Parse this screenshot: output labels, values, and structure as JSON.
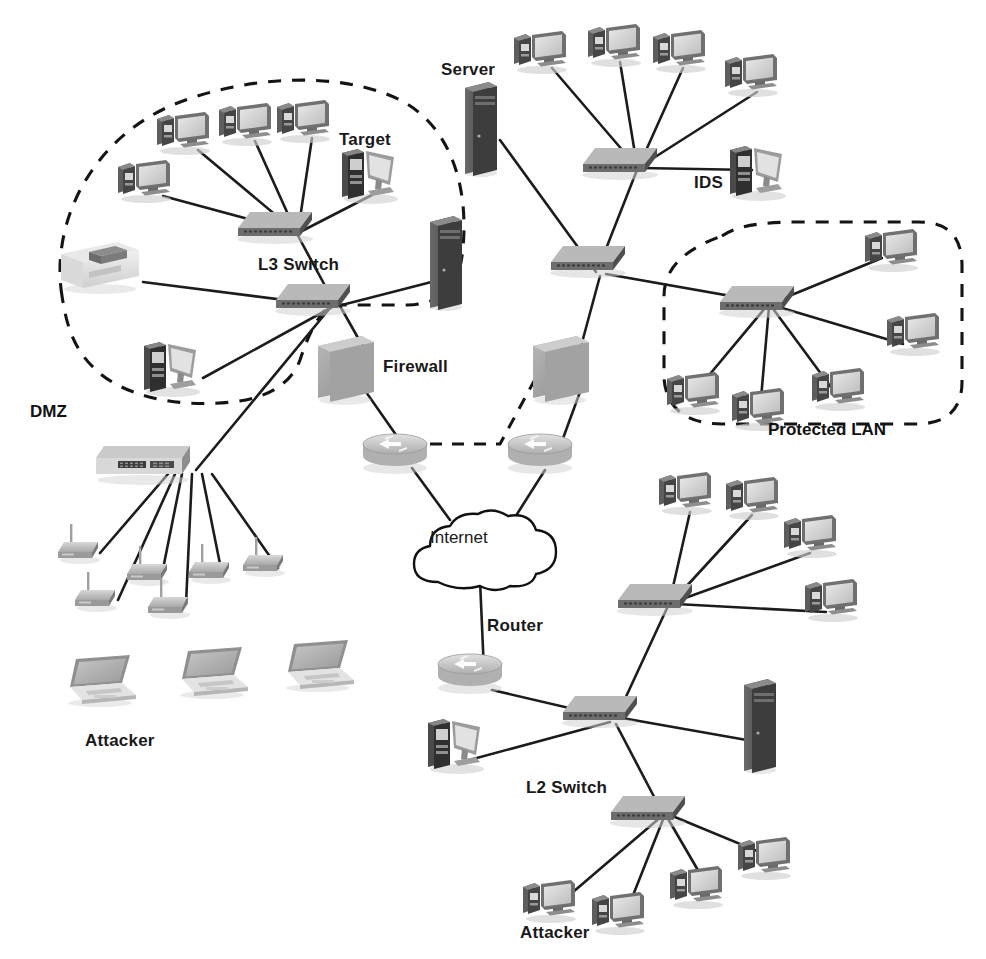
{
  "diagram": {
    "width": 986,
    "height": 959,
    "background_color": "#ffffff",
    "link_color": "#1c1c1c",
    "dashed_zone_color": "#141414"
  },
  "labels": {
    "dmz": "DMZ",
    "protected_lan": "Protected LAN",
    "l3_switch": "L3 Switch",
    "l2_switch": "L2 Switch",
    "target": "Target",
    "server": "Server",
    "ids": "IDS",
    "firewall": "Firewall",
    "internet": "Internet",
    "router": "Router",
    "attacker_left": "Attacker",
    "attacker_bottom": "Attacker"
  },
  "zones": [
    {
      "id": "dmz",
      "label": "DMZ",
      "label_x": 30,
      "label_y": 402,
      "style": "dashed-blob"
    },
    {
      "id": "protected-lan",
      "label": "Protected LAN",
      "label_x": 768,
      "label_y": 422,
      "style": "dashed-rounded"
    }
  ],
  "nodes": [
    {
      "id": "dmz-pc-1",
      "type": "desktop-pc",
      "x": 134,
      "y": 178,
      "label": ""
    },
    {
      "id": "dmz-pc-2",
      "type": "desktop-pc",
      "x": 173,
      "y": 130,
      "label": ""
    },
    {
      "id": "dmz-pc-3",
      "type": "desktop-pc",
      "x": 235,
      "y": 121,
      "label": ""
    },
    {
      "id": "dmz-pc-4",
      "type": "desktop-pc",
      "x": 293,
      "y": 118,
      "label": ""
    },
    {
      "id": "dmz-target",
      "type": "workstation",
      "x": 358,
      "y": 170,
      "label": "Target"
    },
    {
      "id": "dmz-printer",
      "type": "printer",
      "x": 90,
      "y": 262,
      "label": ""
    },
    {
      "id": "dmz-server",
      "type": "server-tower",
      "x": 440,
      "y": 255,
      "label": ""
    },
    {
      "id": "dmz-ws-low",
      "type": "workstation",
      "x": 163,
      "y": 363,
      "label": ""
    },
    {
      "id": "dmz-sw-top",
      "type": "switch",
      "x": 275,
      "y": 222,
      "label": ""
    },
    {
      "id": "l3-switch",
      "type": "switch",
      "x": 312,
      "y": 292,
      "label": "L3 Switch"
    },
    {
      "id": "core-pc-1",
      "type": "desktop-pc",
      "x": 530,
      "y": 49,
      "label": ""
    },
    {
      "id": "core-pc-2",
      "type": "desktop-pc",
      "x": 604,
      "y": 42,
      "label": ""
    },
    {
      "id": "core-pc-3",
      "type": "desktop-pc",
      "x": 669,
      "y": 48,
      "label": ""
    },
    {
      "id": "core-pc-4",
      "type": "desktop-pc",
      "x": 741,
      "y": 72,
      "label": ""
    },
    {
      "id": "main-server",
      "type": "server-tower",
      "x": 481,
      "y": 122,
      "label": "Server"
    },
    {
      "id": "core-switch",
      "type": "switch",
      "x": 620,
      "y": 156,
      "label": ""
    },
    {
      "id": "ids",
      "type": "workstation",
      "x": 752,
      "y": 168,
      "label": "IDS"
    },
    {
      "id": "dist-switch",
      "type": "switch",
      "x": 588,
      "y": 262,
      "label": ""
    },
    {
      "id": "firewall-left",
      "type": "firewall",
      "x": 344,
      "y": 358,
      "label": "Firewall"
    },
    {
      "id": "firewall-right",
      "type": "firewall",
      "x": 556,
      "y": 358,
      "label": ""
    },
    {
      "id": "router-left",
      "type": "router",
      "x": 392,
      "y": 452,
      "label": ""
    },
    {
      "id": "router-right",
      "type": "router",
      "x": 537,
      "y": 452,
      "label": ""
    },
    {
      "id": "internet",
      "type": "cloud",
      "x": 470,
      "y": 540,
      "label": "Internet"
    },
    {
      "id": "router-bottom",
      "type": "router",
      "x": 468,
      "y": 670,
      "label": "Router"
    },
    {
      "id": "lan-switch",
      "type": "switch",
      "x": 757,
      "y": 295,
      "label": ""
    },
    {
      "id": "lan-pc-1",
      "type": "desktop-pc",
      "x": 881,
      "y": 247,
      "label": ""
    },
    {
      "id": "lan-pc-2",
      "type": "desktop-pc",
      "x": 903,
      "y": 331,
      "label": ""
    },
    {
      "id": "lan-pc-3",
      "type": "desktop-pc",
      "x": 683,
      "y": 390,
      "label": ""
    },
    {
      "id": "lan-pc-4",
      "type": "desktop-pc",
      "x": 748,
      "y": 406,
      "label": ""
    },
    {
      "id": "lan-pc-5",
      "type": "desktop-pc",
      "x": 828,
      "y": 386,
      "label": ""
    },
    {
      "id": "ap-switch",
      "type": "rack-switch",
      "x": 140,
      "y": 460,
      "label": ""
    },
    {
      "id": "ap-1",
      "type": "access-point",
      "x": 78,
      "y": 545,
      "label": ""
    },
    {
      "id": "ap-2",
      "type": "access-point",
      "x": 95,
      "y": 593,
      "label": ""
    },
    {
      "id": "ap-3",
      "type": "access-point",
      "x": 147,
      "y": 567,
      "label": ""
    },
    {
      "id": "ap-4",
      "type": "access-point",
      "x": 168,
      "y": 600,
      "label": ""
    },
    {
      "id": "ap-5",
      "type": "access-point",
      "x": 209,
      "y": 565,
      "label": ""
    },
    {
      "id": "ap-6",
      "type": "access-point",
      "x": 263,
      "y": 558,
      "label": ""
    },
    {
      "id": "laptop-1",
      "type": "laptop",
      "x": 95,
      "y": 680,
      "label": "Attacker"
    },
    {
      "id": "laptop-2",
      "type": "laptop",
      "x": 207,
      "y": 672,
      "label": ""
    },
    {
      "id": "laptop-3",
      "type": "laptop",
      "x": 313,
      "y": 665,
      "label": ""
    },
    {
      "id": "br-switch",
      "type": "switch",
      "x": 655,
      "y": 594,
      "label": ""
    },
    {
      "id": "br-pc-1",
      "type": "desktop-pc",
      "x": 675,
      "y": 490,
      "label": ""
    },
    {
      "id": "br-pc-2",
      "type": "desktop-pc",
      "x": 742,
      "y": 495,
      "label": ""
    },
    {
      "id": "br-pc-3",
      "type": "desktop-pc",
      "x": 800,
      "y": 533,
      "label": ""
    },
    {
      "id": "br-pc-4",
      "type": "desktop-pc",
      "x": 821,
      "y": 597,
      "label": ""
    },
    {
      "id": "mid-switch",
      "type": "switch",
      "x": 600,
      "y": 705,
      "label": ""
    },
    {
      "id": "mid-ws",
      "type": "workstation",
      "x": 448,
      "y": 740,
      "label": ""
    },
    {
      "id": "mid-server",
      "type": "server-tower",
      "x": 755,
      "y": 718,
      "label": ""
    },
    {
      "id": "l2-switch",
      "type": "switch",
      "x": 648,
      "y": 805,
      "label": "L2 Switch"
    },
    {
      "id": "atk-pc-1",
      "type": "desktop-pc",
      "x": 543,
      "y": 898,
      "label": "Attacker"
    },
    {
      "id": "atk-pc-2",
      "type": "desktop-pc",
      "x": 612,
      "y": 910,
      "label": ""
    },
    {
      "id": "atk-pc-3",
      "type": "desktop-pc",
      "x": 690,
      "y": 884,
      "label": ""
    },
    {
      "id": "atk-pc-4",
      "type": "desktop-pc",
      "x": 758,
      "y": 855,
      "label": ""
    }
  ],
  "links": [
    {
      "from": "dmz-pc-1",
      "to": "dmz-sw-top"
    },
    {
      "from": "dmz-pc-2",
      "to": "dmz-sw-top"
    },
    {
      "from": "dmz-pc-3",
      "to": "dmz-sw-top"
    },
    {
      "from": "dmz-pc-4",
      "to": "dmz-sw-top"
    },
    {
      "from": "dmz-target",
      "to": "dmz-sw-top"
    },
    {
      "from": "dmz-sw-top",
      "to": "l3-switch"
    },
    {
      "from": "dmz-printer",
      "to": "l3-switch"
    },
    {
      "from": "dmz-server",
      "to": "l3-switch"
    },
    {
      "from": "dmz-ws-low",
      "to": "l3-switch"
    },
    {
      "from": "l3-switch",
      "to": "ap-switch"
    },
    {
      "from": "l3-switch",
      "to": "firewall-left"
    },
    {
      "from": "firewall-left",
      "to": "router-left"
    },
    {
      "from": "router-left",
      "to": "internet"
    },
    {
      "from": "router-right",
      "to": "internet"
    },
    {
      "from": "firewall-right",
      "to": "router-right"
    },
    {
      "from": "firewall-right",
      "to": "dist-switch"
    },
    {
      "from": "core-pc-1",
      "to": "core-switch"
    },
    {
      "from": "core-pc-2",
      "to": "core-switch"
    },
    {
      "from": "core-pc-3",
      "to": "core-switch"
    },
    {
      "from": "core-pc-4",
      "to": "core-switch"
    },
    {
      "from": "main-server",
      "to": "dist-switch"
    },
    {
      "from": "ids",
      "to": "core-switch"
    },
    {
      "from": "core-switch",
      "to": "dist-switch"
    },
    {
      "from": "dist-switch",
      "to": "lan-switch"
    },
    {
      "from": "lan-switch",
      "to": "lan-pc-1"
    },
    {
      "from": "lan-switch",
      "to": "lan-pc-2"
    },
    {
      "from": "lan-switch",
      "to": "lan-pc-3"
    },
    {
      "from": "lan-switch",
      "to": "lan-pc-4"
    },
    {
      "from": "lan-switch",
      "to": "lan-pc-5"
    },
    {
      "from": "ap-switch",
      "to": "ap-1"
    },
    {
      "from": "ap-switch",
      "to": "ap-2"
    },
    {
      "from": "ap-switch",
      "to": "ap-3"
    },
    {
      "from": "ap-switch",
      "to": "ap-4"
    },
    {
      "from": "ap-switch",
      "to": "ap-5"
    },
    {
      "from": "ap-switch",
      "to": "ap-6"
    },
    {
      "from": "internet",
      "to": "router-bottom"
    },
    {
      "from": "router-bottom",
      "to": "mid-switch"
    },
    {
      "from": "br-switch",
      "to": "br-pc-1"
    },
    {
      "from": "br-switch",
      "to": "br-pc-2"
    },
    {
      "from": "br-switch",
      "to": "br-pc-3"
    },
    {
      "from": "br-switch",
      "to": "br-pc-4"
    },
    {
      "from": "br-switch",
      "to": "mid-switch"
    },
    {
      "from": "mid-switch",
      "to": "mid-ws"
    },
    {
      "from": "mid-switch",
      "to": "mid-server"
    },
    {
      "from": "mid-switch",
      "to": "l2-switch"
    },
    {
      "from": "l2-switch",
      "to": "atk-pc-1"
    },
    {
      "from": "l2-switch",
      "to": "atk-pc-2"
    },
    {
      "from": "l2-switch",
      "to": "atk-pc-3"
    },
    {
      "from": "l2-switch",
      "to": "atk-pc-4"
    }
  ],
  "dashed_link": {
    "from": "router-left",
    "to": "firewall-right",
    "style": "dashed"
  }
}
